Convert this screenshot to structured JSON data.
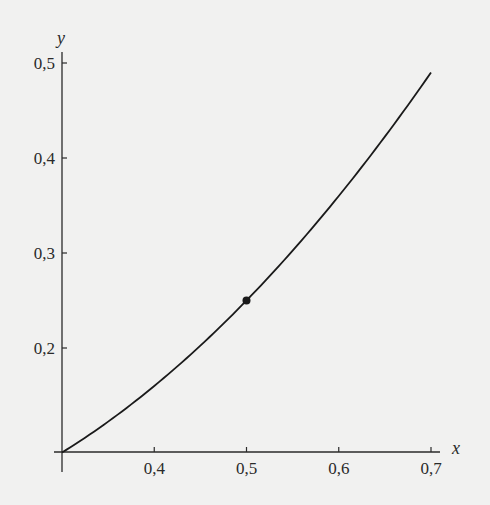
{
  "chart_data": {
    "type": "line",
    "title": "",
    "xlabel": "x",
    "ylabel": "y",
    "xlim": [
      0.3,
      0.7
    ],
    "ylim": [
      0.09,
      0.5
    ],
    "grid": false,
    "legend": null,
    "x_ticks": [
      {
        "value": 0.4,
        "label": "0,4"
      },
      {
        "value": 0.5,
        "label": "0,5"
      },
      {
        "value": 0.6,
        "label": "0,6"
      },
      {
        "value": 0.7,
        "label": "0,7"
      }
    ],
    "y_ticks": [
      {
        "value": 0.2,
        "label": "0,2"
      },
      {
        "value": 0.3,
        "label": "0,3"
      },
      {
        "value": 0.4,
        "label": "0,4"
      },
      {
        "value": 0.5,
        "label": "0,5"
      }
    ],
    "series": [
      {
        "name": "y = x^2",
        "x": [
          0.3,
          0.35,
          0.4,
          0.45,
          0.5,
          0.55,
          0.6,
          0.65,
          0.7
        ],
        "y": [
          0.09,
          0.1225,
          0.16,
          0.2025,
          0.25,
          0.3025,
          0.36,
          0.4225,
          0.49
        ],
        "color": "#1a1a1a"
      }
    ],
    "annotations": [
      {
        "type": "point",
        "x": 0.5,
        "y": 0.25,
        "color": "#1a1a1a"
      }
    ]
  },
  "colors": {
    "background": "#f1f1f0",
    "ink": "#1a1a1a"
  }
}
